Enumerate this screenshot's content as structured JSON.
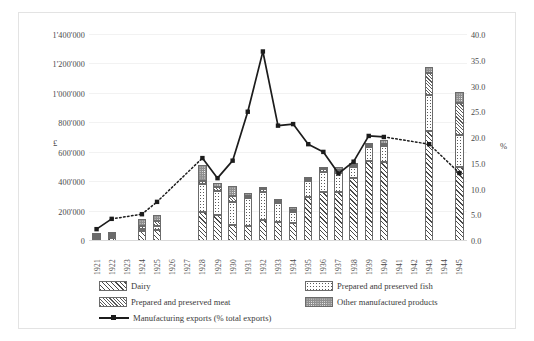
{
  "chart_data": {
    "type": "bar",
    "title": "",
    "subtitle": "",
    "xlabel": "",
    "ylabel": "£",
    "y2label": "%",
    "grid": true,
    "legend_position": "bottom",
    "ylim": [
      0,
      1400000
    ],
    "y2lim": [
      0,
      40
    ],
    "yticks": [
      "0",
      "200'000",
      "400'000",
      "600'000",
      "800'000",
      "1'000'000",
      "1'200'000",
      "1'400'000"
    ],
    "ytick_values": [
      0,
      200000,
      400000,
      600000,
      800000,
      1000000,
      1200000,
      1400000
    ],
    "y2ticks": [
      "0.0",
      "5.0",
      "10.0",
      "15.0",
      "20.0",
      "25.0",
      "30.0",
      "35.0",
      "40.0"
    ],
    "y2tick_values": [
      0,
      5,
      10,
      15,
      20,
      25,
      30,
      35,
      40
    ],
    "categories": [
      "1921",
      "1922",
      "1923",
      "1924",
      "1925",
      "1926",
      "1927",
      "1928",
      "1929",
      "1930",
      "1931",
      "1932",
      "1933",
      "1934",
      "1935",
      "1936",
      "1937",
      "1938",
      "1939",
      "1940",
      "1941",
      "1942",
      "1943",
      "1944",
      "1945"
    ],
    "series": [
      {
        "name": "Dairy",
        "pattern": "diagonal-hatch",
        "values": [
          12000,
          20000,
          null,
          70000,
          75000,
          null,
          null,
          200000,
          175000,
          110000,
          105000,
          140000,
          130000,
          125000,
          300000,
          330000,
          335000,
          430000,
          545000,
          535000,
          null,
          null,
          745000,
          null,
          505000
        ]
      },
      {
        "name": "Prepared and preserved fish",
        "pattern": "dotted",
        "values": [
          6000,
          6000,
          null,
          10000,
          30000,
          null,
          null,
          185000,
          165000,
          155000,
          190000,
          195000,
          130000,
          75000,
          110000,
          140000,
          125000,
          70000,
          95000,
          110000,
          null,
          null,
          245000,
          null,
          215000
        ]
      },
      {
        "name": "Prepared and preserved meat",
        "pattern": "cross-hatch",
        "values": [
          6000,
          8000,
          null,
          20000,
          30000,
          null,
          null,
          20000,
          25000,
          40000,
          10000,
          20000,
          10000,
          10000,
          10000,
          20000,
          25000,
          10000,
          10000,
          15000,
          null,
          null,
          150000,
          null,
          215000
        ]
      },
      {
        "name": "Other manufactured products",
        "pattern": "speckled-dark",
        "values": [
          8000,
          8000,
          null,
          45000,
          45000,
          null,
          null,
          115000,
          30000,
          70000,
          15000,
          10000,
          15000,
          15000,
          10000,
          10000,
          20000,
          10000,
          10000,
          25000,
          null,
          null,
          45000,
          null,
          75000
        ]
      }
    ],
    "line_series": {
      "name": "Manufacturing exports (% total exports)",
      "axis": "right",
      "marker": "square",
      "values": [
        2.3,
        4.3,
        null,
        5.2,
        7.6,
        null,
        null,
        16.1,
        12.2,
        15.6,
        25.1,
        36.8,
        22.4,
        22.7,
        18.8,
        17.3,
        13.1,
        15.4,
        20.4,
        20.2,
        null,
        null,
        18.8,
        null,
        13.2
      ],
      "dashed_segments": [
        [
          1922,
          1924
        ],
        [
          1924,
          1925
        ],
        [
          1925,
          1928
        ],
        [
          1940,
          1943
        ],
        [
          1943,
          1945
        ]
      ]
    },
    "legend": [
      {
        "label": "Dairy",
        "pattern": "diagonal-hatch"
      },
      {
        "label": "Prepared and preserved fish",
        "pattern": "dotted"
      },
      {
        "label": "Prepared and preserved meat",
        "pattern": "cross-hatch"
      },
      {
        "label": "Other manufactured products",
        "pattern": "speckled-dark"
      },
      {
        "label": "Manufacturing exports (% total exports)",
        "pattern": "line-marker"
      }
    ],
    "colors": {
      "line": "#1c1c1c",
      "bar_outline": "#6b6b6b",
      "grid": "#f2f2f2",
      "text": "#3a3a3a",
      "other_fill": "#8e8e8e"
    }
  }
}
